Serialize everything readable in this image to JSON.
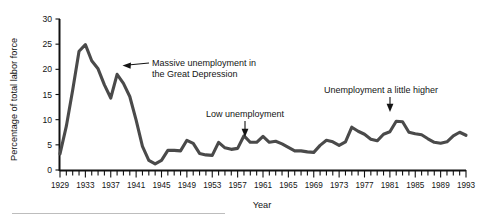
{
  "figure": {
    "background_color": "#ffffff",
    "line_color": "#4a4a4a",
    "axis_color": "#111111",
    "text_color": "#141414"
  },
  "axes": {
    "x_axis_title": "Year",
    "y_axis_title": "Percentage of total labor force",
    "y_tick_labels": [
      "0",
      "5",
      "10",
      "15",
      "20",
      "25",
      "30"
    ],
    "x_tick_labels": [
      "1929",
      "1933",
      "1937",
      "1941",
      "1945",
      "1949",
      "1953",
      "1957",
      "1961",
      "1965",
      "1969",
      "1973",
      "1977",
      "1981",
      "1985",
      "1989",
      "1993"
    ]
  },
  "annotations": [
    {
      "id": "depression",
      "line1": "Massive unemployment in",
      "line2": "the Great Depression",
      "text_x": 152,
      "text_y": 66,
      "arrow_from_x": 150,
      "arrow_from_y": 72,
      "arrow_to_x": 125,
      "arrow_to_y": 74,
      "direction": "left"
    },
    {
      "id": "low-unemployment",
      "line1": "Low unemployment",
      "line2": "",
      "text_x": 206,
      "text_y": 117,
      "arrow_from_x": 245,
      "arrow_from_y": 121,
      "arrow_to_x": 245,
      "arrow_to_y": 135,
      "direction": "down"
    },
    {
      "id": "higher-unemployment",
      "line1": "Unemployment a little higher",
      "line2": "",
      "text_x": 324,
      "text_y": 93,
      "arrow_from_x": 390,
      "arrow_from_y": 97,
      "arrow_to_x": 390,
      "arrow_to_y": 110,
      "direction": "down"
    }
  ],
  "chart_data": {
    "type": "line",
    "title": "",
    "subtitle": "",
    "xlabel": "Year",
    "ylabel": "Percentage of total labor force",
    "xlim": [
      1929,
      1993
    ],
    "ylim": [
      0,
      30
    ],
    "grid": false,
    "legend": "none",
    "x_tick_interval_minor": 1,
    "x_tick_interval_labeled": 4,
    "y_tick_interval": 5,
    "series": [
      {
        "name": "Unemployment rate",
        "color": "#4a4a4a",
        "x": [
          1929,
          1930,
          1931,
          1932,
          1933,
          1934,
          1935,
          1936,
          1937,
          1938,
          1939,
          1940,
          1941,
          1942,
          1943,
          1944,
          1945,
          1946,
          1947,
          1948,
          1949,
          1950,
          1951,
          1952,
          1953,
          1954,
          1955,
          1956,
          1957,
          1958,
          1959,
          1960,
          1961,
          1962,
          1963,
          1964,
          1965,
          1966,
          1967,
          1968,
          1969,
          1970,
          1971,
          1972,
          1973,
          1974,
          1975,
          1976,
          1977,
          1978,
          1979,
          1980,
          1981,
          1982,
          1983,
          1984,
          1985,
          1986,
          1987,
          1988,
          1989,
          1990,
          1991,
          1992,
          1993
        ],
        "values": [
          3.2,
          8.7,
          15.9,
          23.6,
          24.9,
          21.7,
          20.1,
          16.9,
          14.3,
          19.0,
          17.2,
          14.6,
          9.9,
          4.7,
          1.9,
          1.2,
          1.9,
          3.9,
          3.9,
          3.8,
          5.9,
          5.3,
          3.3,
          3.0,
          2.9,
          5.5,
          4.4,
          4.1,
          4.3,
          6.8,
          5.5,
          5.5,
          6.7,
          5.5,
          5.7,
          5.2,
          4.5,
          3.8,
          3.8,
          3.6,
          3.5,
          4.9,
          5.9,
          5.6,
          4.9,
          5.6,
          8.5,
          7.7,
          7.1,
          6.1,
          5.8,
          7.1,
          7.6,
          9.7,
          9.6,
          7.5,
          7.2,
          7.0,
          6.2,
          5.5,
          5.3,
          5.6,
          6.8,
          7.5,
          6.9
        ]
      }
    ]
  }
}
